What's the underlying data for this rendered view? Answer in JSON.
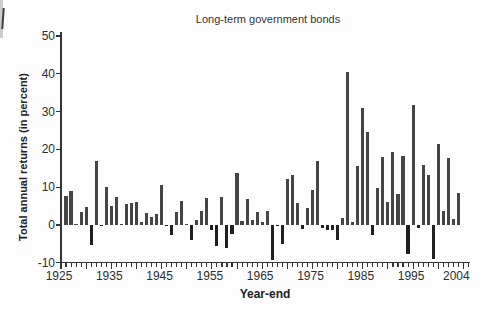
{
  "page": {
    "background": "#fdfdfd"
  },
  "colors": {
    "axis": "#343434",
    "text": "#2e2e2e",
    "bar_positive": "#454545",
    "bar_negative": "#1f1f1f",
    "scan_strip": "#cccccc"
  },
  "chart_data": {
    "type": "bar",
    "title": "Long-term government bonds",
    "ylabel": "Total annual returns (in percent)",
    "xlabel": "Year-end",
    "ylim": [
      -10,
      50
    ],
    "yticks": [
      50,
      40,
      30,
      20,
      10,
      0,
      -10
    ],
    "xtick_labels": [
      "1925",
      "1935",
      "1945",
      "1955",
      "1965",
      "1975",
      "1985",
      "1995",
      "2004"
    ],
    "x_range": [
      1925,
      2005
    ],
    "grid": false,
    "legend": false,
    "x": [
      1926,
      1927,
      1928,
      1929,
      1930,
      1931,
      1932,
      1933,
      1934,
      1935,
      1936,
      1937,
      1938,
      1939,
      1940,
      1941,
      1942,
      1943,
      1944,
      1945,
      1946,
      1947,
      1948,
      1949,
      1950,
      1951,
      1952,
      1953,
      1954,
      1955,
      1956,
      1957,
      1958,
      1959,
      1960,
      1961,
      1962,
      1963,
      1964,
      1965,
      1966,
      1967,
      1968,
      1969,
      1970,
      1971,
      1972,
      1973,
      1974,
      1975,
      1976,
      1977,
      1978,
      1979,
      1980,
      1981,
      1982,
      1983,
      1984,
      1985,
      1986,
      1987,
      1988,
      1989,
      1990,
      1991,
      1992,
      1993,
      1994,
      1995,
      1996,
      1997,
      1998,
      1999,
      2000,
      2001,
      2002,
      2003,
      2004
    ],
    "values": [
      7.8,
      8.9,
      0.1,
      3.4,
      4.7,
      -5.3,
      16.8,
      -0.1,
      10.0,
      5.0,
      7.5,
      0.2,
      5.5,
      5.9,
      6.1,
      0.9,
      3.2,
      2.1,
      2.8,
      10.7,
      -0.1,
      -2.6,
      3.4,
      6.4,
      0.1,
      -3.9,
      1.2,
      3.6,
      7.2,
      -1.3,
      -5.6,
      7.5,
      -6.1,
      -2.3,
      13.8,
      1.0,
      6.9,
      1.2,
      3.5,
      0.7,
      3.7,
      -9.2,
      -0.3,
      -5.1,
      12.1,
      13.2,
      5.7,
      -1.1,
      4.4,
      9.2,
      16.8,
      -0.7,
      -1.2,
      -1.2,
      -4.0,
      1.9,
      40.4,
      0.7,
      15.5,
      31.0,
      24.5,
      -2.7,
      9.7,
      18.1,
      6.2,
      19.3,
      8.1,
      18.2,
      -7.8,
      31.7,
      -0.9,
      15.9,
      13.1,
      -9.0,
      21.5,
      3.7,
      17.8,
      1.5,
      8.5
    ]
  }
}
